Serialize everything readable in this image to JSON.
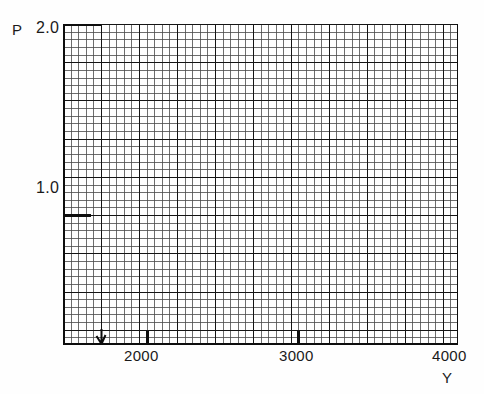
{
  "figure": {
    "background_color": "#fefefe",
    "ink_color": "#1a1a1a"
  },
  "labels": {
    "p_axis_label": "P",
    "y_axis_label": "Y"
  },
  "chart_data": {
    "type": "line",
    "title": "",
    "xlabel": "Y",
    "ylabel": "P",
    "series": [],
    "x": [],
    "grid": true,
    "legend": null,
    "xlim": [
      1600,
      4000
    ],
    "ylim": [
      0.352,
      2.0
    ],
    "x_ticks": [
      2000,
      3000,
      4000
    ],
    "x_tick_labels": [
      "2000",
      "3000",
      "4000"
    ],
    "y_ticks": [
      1.0,
      2.0
    ],
    "y_tick_labels": [
      "1.0",
      "2.0"
    ],
    "grid_minor_spacing_x": 31.0,
    "grid_minor_spacing_y": 0.0259,
    "grid_major_every": 5,
    "annotations": [
      {
        "name": "origin-arrow-marker",
        "x": 1700,
        "y": 0.352,
        "symbol": "arrow"
      }
    ]
  },
  "geometry": {
    "plot_left": 63,
    "plot_top": 24,
    "plot_width": 395,
    "plot_height": 321,
    "minor_cols": 52,
    "minor_rows": 42,
    "major_every": 5,
    "y_tick_1_0_row": 25,
    "x_tick_2000_col": 11,
    "x_tick_3000_col": 31,
    "x_tick_4000_col": 51
  }
}
